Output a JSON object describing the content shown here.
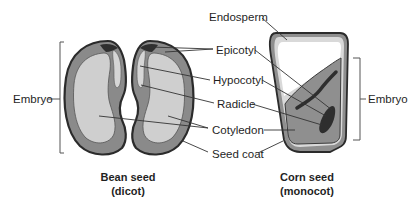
{
  "diagram": {
    "type": "labeled-illustration",
    "colors": {
      "seed_coat_outline": "#2b2b2b",
      "cotyledon_dark": "#8a8a8a",
      "cotyledon_light": "#cfcfcf",
      "embryo_axis": "#3a3a3a",
      "endosperm": "#ffffff",
      "endosperm_edge": "#d9d9d9",
      "corn_embryo": "#8f8f8f",
      "leader_lines": "#333333"
    },
    "left": {
      "bracket_label": "Embryo",
      "caption_line1": "Bean seed",
      "caption_line2": "(dicot)"
    },
    "center_labels": [
      "Endosperm",
      "Epicotyl",
      "Hypocotyl",
      "Radicle",
      "Cotyledon",
      "Seed coat"
    ],
    "right": {
      "bracket_label": "Embryo",
      "caption_line1": "Corn seed",
      "caption_line2": "(monocot)"
    }
  }
}
